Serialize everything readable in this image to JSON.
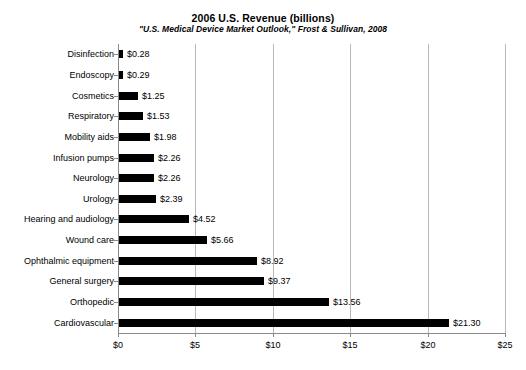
{
  "chart_data": {
    "type": "bar",
    "orientation": "horizontal",
    "title": "2006 U.S. Revenue (billions)",
    "subtitle": "\"U.S. Medical Device Market Outlook,\" Frost & Sullivan, 2008",
    "xlabel": "",
    "ylabel": "",
    "xlim": [
      0,
      25
    ],
    "xticks": [
      0,
      5,
      10,
      15,
      20,
      25
    ],
    "xtick_labels": [
      "$0",
      "$5",
      "$10",
      "$15",
      "$20",
      "$25"
    ],
    "grid": "vertical",
    "legend": "none",
    "bar_color": "#000000",
    "categories": [
      "Disinfection",
      "Endoscopy",
      "Cosmetics",
      "Respiratory",
      "Mobility aids",
      "Infusion pumps",
      "Neurology",
      "Urology",
      "Hearing and audiology",
      "Wound care",
      "Ophthalmic equipment",
      "General surgery",
      "Orthopedic",
      "Cardiovascular"
    ],
    "values": [
      0.28,
      0.29,
      1.25,
      1.53,
      1.98,
      2.26,
      2.26,
      2.39,
      4.52,
      5.66,
      8.92,
      9.37,
      13.56,
      21.3
    ],
    "value_labels": [
      "$0.28",
      "$0.29",
      "$1.25",
      "$1.53",
      "$1.98",
      "$2.26",
      "$2.26",
      "$2.39",
      "$4.52",
      "$5.66",
      "$8.92",
      "$9.37",
      "$13.56",
      "$21.30"
    ]
  }
}
